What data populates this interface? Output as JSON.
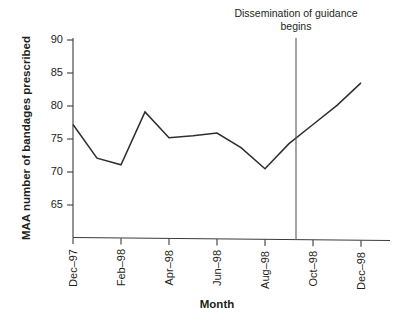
{
  "chart_data": {
    "type": "line",
    "title": "",
    "xlabel": "Month",
    "ylabel": "MAA number of bandages prescribed",
    "ylim": [
      61,
      90
    ],
    "yticks": [
      65,
      70,
      75,
      80,
      85,
      90
    ],
    "ytick_labels": [
      "65",
      "70",
      "75",
      "80",
      "85",
      "90"
    ],
    "xtick_labels": [
      "Dec–97",
      "Feb–98",
      "Apr–98",
      "Jun–98",
      "Aug–98",
      "Oct–98",
      "Dec–98"
    ],
    "x": [
      "Dec-97",
      "Jan-98",
      "Feb-98",
      "Mar-98",
      "Apr-98",
      "May-98",
      "Jun-98",
      "Jul-98",
      "Aug-98",
      "Sep-98",
      "Oct-98",
      "Nov-98",
      "Dec-98"
    ],
    "values": [
      77.2,
      72.1,
      71.1,
      79.1,
      75.2,
      75.5,
      75.9,
      73.7,
      70.5,
      74.3,
      77.2,
      80.1,
      83.5
    ],
    "grid": false,
    "legend": false,
    "line_color": "#2e2e2e",
    "annotations": [
      {
        "text_line_1": "Dissemination of guidance",
        "text_line_2": "begins",
        "at_x": "Sep-98",
        "kind": "vertical-reference-line"
      }
    ]
  },
  "axis": {
    "y_title": "MAA number of bandages prescribed",
    "x_title": "Month"
  },
  "annotation": {
    "line_1": "Dissemination of guidance",
    "line_2": "begins"
  }
}
